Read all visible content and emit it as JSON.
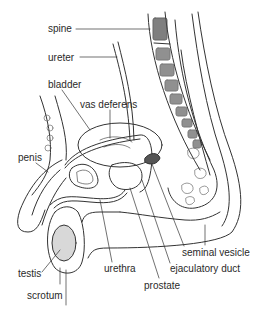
{
  "diagram": {
    "type": "anatomical sagittal section",
    "line_color": "#333333",
    "background": "#ffffff",
    "labels": [
      {
        "id": "spine",
        "text": "spine",
        "x": 48,
        "y": 23
      },
      {
        "id": "ureter",
        "text": "ureter",
        "x": 48,
        "y": 52
      },
      {
        "id": "bladder",
        "text": "bladder",
        "x": 48,
        "y": 79
      },
      {
        "id": "vas-deferens",
        "text": "vas deferens",
        "x": 80,
        "y": 99
      },
      {
        "id": "penis",
        "text": "penis",
        "x": 18,
        "y": 152
      },
      {
        "id": "testis",
        "text": "testis",
        "x": 18,
        "y": 268
      },
      {
        "id": "scrotum",
        "text": "scrotum",
        "x": 27,
        "y": 290
      },
      {
        "id": "urethra",
        "text": "urethra",
        "x": 104,
        "y": 263
      },
      {
        "id": "seminal-vesicle",
        "text": "seminal vesicle",
        "x": 182,
        "y": 247
      },
      {
        "id": "ejaculatory-duct",
        "text": "ejaculatory duct",
        "x": 170,
        "y": 263
      },
      {
        "id": "prostate",
        "text": "prostate",
        "x": 144,
        "y": 280
      }
    ]
  }
}
